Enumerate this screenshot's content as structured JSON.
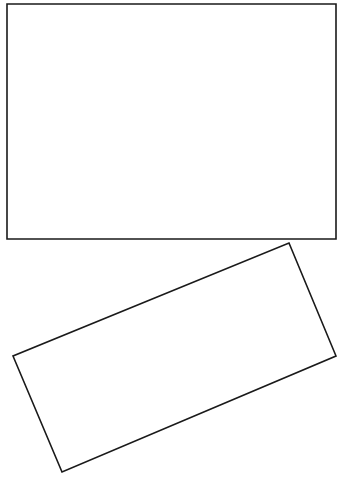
{
  "canvas": {
    "width": 349,
    "height": 484,
    "background_color": "#ffffff",
    "description": "Two empty outlined rectangles on a plain white background"
  },
  "style": {
    "stroke_color": "#1a1a1a",
    "fill_color": "#ffffff",
    "stroke_width": 1.6
  },
  "shapes": [
    {
      "name": "upper-rectangle",
      "kind": "rectangle",
      "orientation": "axis-aligned",
      "rotation_degrees": 0,
      "x": 7,
      "y": 4,
      "width": 329,
      "height": 235,
      "points": "7,4 336,4 336,239 7,239",
      "fill": "#ffffff",
      "stroke": "#1a1a1a"
    },
    {
      "name": "lower-rotated-rectangle",
      "kind": "rectangle",
      "orientation": "rotated",
      "rotation_degrees": -23,
      "width": 298,
      "height": 125,
      "points": "289,243 336,356 62,472 13,356",
      "fill": "#ffffff",
      "stroke": "#1a1a1a"
    }
  ]
}
